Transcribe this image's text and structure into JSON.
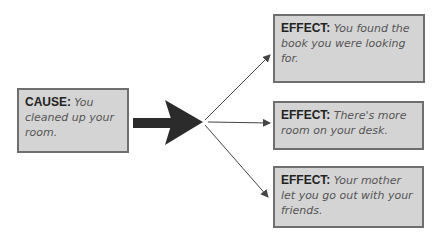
{
  "diagram": {
    "type": "cause-effect",
    "cause": {
      "label": "CAUSE:",
      "text": "You cleaned up your room."
    },
    "effects": [
      {
        "label": "EFFECT:",
        "text": "You found the book you were looking for."
      },
      {
        "label": "EFFECT:",
        "text": "There's more room on your desk."
      },
      {
        "label": "EFFECT:",
        "text": "Your mother let you go out with your friends."
      }
    ],
    "colors": {
      "box_fill": "#d4d4d4",
      "box_border": "#6e6e6e",
      "arrow": "#2b2b2b"
    }
  }
}
